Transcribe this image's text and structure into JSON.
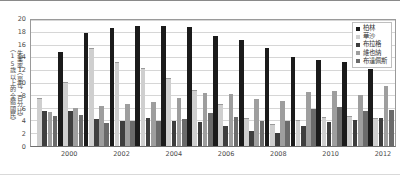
{
  "chart_data": {
    "type": "bar",
    "title": "",
    "xlabel": "",
    "ylabel": "失業率（單位：百分比）（15歲以上的全體國民）",
    "ylabel_line1": "失業率（單位：百分比）",
    "ylabel_line2": "（15歲以上的全體國民）",
    "ylim": [
      0,
      20
    ],
    "ytick_step": 2,
    "yticks": [
      "0",
      "2",
      "4",
      "6",
      "8",
      "10",
      "12",
      "14",
      "16",
      "18",
      "20"
    ],
    "grid": true,
    "legend_position": "top-right",
    "categories": [
      "1999",
      "2000",
      "2001",
      "2002",
      "2003",
      "2004",
      "2005",
      "2006",
      "2007",
      "2008",
      "2009",
      "2010",
      "2011",
      "2012"
    ],
    "xtick_labels": [
      "2000",
      "2002",
      "2004",
      "2006",
      "2008",
      "2010",
      "2012"
    ],
    "xtick_indices": [
      1,
      3,
      5,
      7,
      9,
      11,
      13
    ],
    "series": [
      {
        "name": "柏林",
        "color": "#1b1b1b",
        "values": [
          null,
          15.0,
          17.9,
          18.8,
          19.1,
          19.0,
          18.9,
          17.5,
          16.9,
          15.5,
          14.1,
          13.6,
          13.3,
          12.3
        ]
      },
      {
        "name": "華沙",
        "color": "#cfcfcf",
        "values": [
          7.6,
          10.2,
          15.5,
          13.3,
          12.4,
          10.8,
          8.9,
          6.6,
          4.4,
          3.5,
          4.1,
          4.6,
          4.8,
          4.4
        ]
      },
      {
        "name": "布拉格",
        "color": "#3e3e3e",
        "values": [
          5.6,
          5.5,
          4.3,
          4.0,
          4.5,
          4.0,
          3.8,
          3.2,
          2.4,
          2.1,
          3.1,
          3.8,
          4.1,
          4.5
        ]
      },
      {
        "name": "維也納",
        "color": "#9e9e9e",
        "values": [
          5.4,
          6.1,
          6.3,
          6.7,
          7.0,
          7.6,
          8.4,
          8.3,
          7.5,
          7.2,
          8.6,
          8.8,
          8.1,
          9.5
        ]
      },
      {
        "name": "布達佩斯",
        "color": "#6b6b6b",
        "values": [
          4.8,
          5.0,
          3.7,
          3.9,
          3.9,
          4.3,
          5.2,
          4.6,
          4.0,
          3.9,
          5.9,
          6.2,
          5.5,
          5.7
        ]
      }
    ]
  },
  "legend": {
    "items": [
      {
        "label": "柏林"
      },
      {
        "label": "華沙"
      },
      {
        "label": "布拉格"
      },
      {
        "label": "維也納"
      },
      {
        "label": "布達佩斯"
      }
    ]
  }
}
